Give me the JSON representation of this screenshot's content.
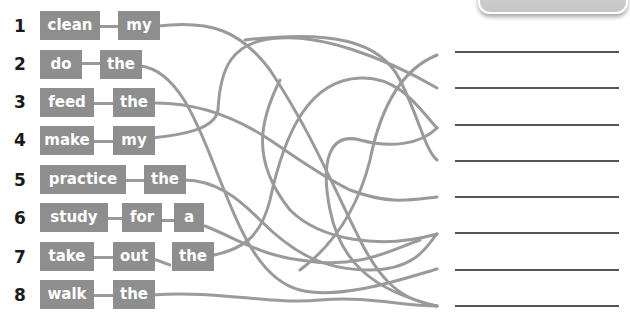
{
  "exercise": {
    "type": "word-maze-matching",
    "rows": [
      {
        "number": "1",
        "words": [
          "clean",
          "my"
        ]
      },
      {
        "number": "2",
        "words": [
          "do",
          "the"
        ]
      },
      {
        "number": "3",
        "words": [
          "feed",
          "the"
        ]
      },
      {
        "number": "4",
        "words": [
          "make",
          "my"
        ]
      },
      {
        "number": "5",
        "words": [
          "practice",
          "the"
        ]
      },
      {
        "number": "6",
        "words": [
          "study",
          "for",
          "a"
        ]
      },
      {
        "number": "7",
        "words": [
          "take",
          "out",
          "the"
        ]
      },
      {
        "number": "8",
        "words": [
          "walk",
          "the"
        ]
      }
    ],
    "answer_lines": [
      "",
      "",
      "",
      "",
      "",
      "",
      "",
      ""
    ]
  },
  "colors": {
    "word_box": "#8e8e8e",
    "word_text": "#ffffff",
    "maze_line": "#9a9a9a",
    "answer_line": "#555555",
    "number_text": "#1a1a1a"
  }
}
